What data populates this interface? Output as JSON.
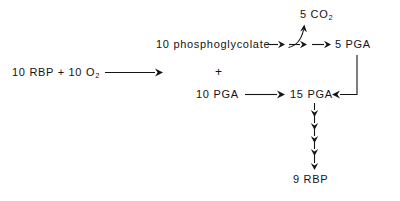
{
  "diagram": {
    "background_color": "#ffffff",
    "ink_color": "#141414",
    "nodes": {
      "substrate": {
        "label": "10 RBP + 10 O",
        "subscript": "2",
        "full_text": "10 RBP + 10 O2"
      },
      "phosphoglycolate": {
        "label": "10  phosphoglycolate"
      },
      "plus": {
        "label": "+"
      },
      "co2": {
        "label": "5 CO",
        "subscript": "2",
        "full_text": "5 CO2"
      },
      "pga5": {
        "label": "5 PGA"
      },
      "pga10": {
        "label": "10 PGA"
      },
      "pga15": {
        "label": "15 PGA"
      },
      "rbp9": {
        "label": "9 RBP"
      }
    },
    "arrows": {
      "substrate_to_products": "long horizontal arrow",
      "phosphoglycolate_to_branch": "horizontal arrow",
      "branch_curved_to_co2": "curved arrow releasing 5 CO2",
      "branch_horizontal": "horizontal arrow",
      "branch_to_pga5": "horizontal arrow",
      "pga10_to_pga15": "horizontal arrow",
      "pga5_feedback_to_pga15": "elbow feedback arrow pointing left",
      "pga15_to_rbp9_count": 5,
      "pga15_to_rbp9": "five stacked downward arrows"
    }
  }
}
